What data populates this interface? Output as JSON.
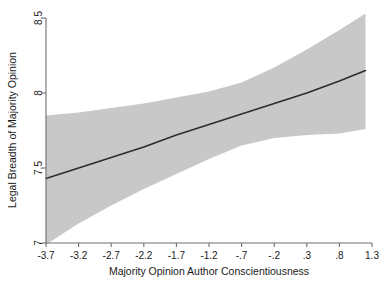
{
  "chart_data": {
    "type": "line",
    "title": "",
    "subtitle": "",
    "xlabel": "Majority Opinion Author Conscientiousness",
    "ylabel": "Legal Breadth of Majority Opinion",
    "xlim": [
      -3.7,
      1.3
    ],
    "ylim": [
      7,
      8.5
    ],
    "xticks": [
      -3.7,
      -3.2,
      -2.7,
      -2.2,
      -1.7,
      -1.2,
      -0.7,
      -0.2,
      0.3,
      0.8,
      1.3
    ],
    "xtick_labels": [
      "-3.7",
      "-3.2",
      "-2.7",
      "-2.2",
      "-1.7",
      "-1.2",
      "-.7",
      "-.2",
      ".3",
      ".8",
      "1.3"
    ],
    "yticks": [
      7,
      7.5,
      8,
      8.5
    ],
    "ytick_labels": [
      "7",
      "7.5",
      "8",
      "8.5"
    ],
    "grid": false,
    "legend": "none",
    "series": [
      {
        "name": "Predicted legal breadth",
        "kind": "line",
        "color": "#2b2b2b",
        "x": [
          -3.7,
          -3.2,
          -2.7,
          -2.2,
          -1.7,
          -1.2,
          -0.7,
          -0.2,
          0.3,
          0.8,
          1.2
        ],
        "values": [
          7.43,
          7.5,
          7.57,
          7.64,
          7.72,
          7.79,
          7.86,
          7.93,
          8.0,
          8.08,
          8.15
        ]
      },
      {
        "name": "95% confidence interval",
        "kind": "band",
        "color": "#c8c8c8",
        "x": [
          -3.7,
          -3.2,
          -2.7,
          -2.2,
          -1.7,
          -1.2,
          -0.7,
          -0.2,
          0.3,
          0.8,
          1.2
        ],
        "upper": [
          7.85,
          7.87,
          7.9,
          7.93,
          7.97,
          8.01,
          8.07,
          8.17,
          8.29,
          8.42,
          8.53
        ],
        "lower": [
          6.99,
          7.13,
          7.25,
          7.36,
          7.46,
          7.56,
          7.65,
          7.7,
          7.72,
          7.73,
          7.76
        ]
      }
    ]
  },
  "axes": {
    "y_axis_name": "legal-breadth-axis",
    "x_axis_name": "conscientiousness-axis"
  }
}
